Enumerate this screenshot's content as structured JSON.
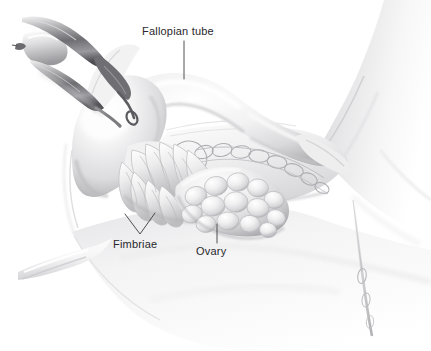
{
  "figure": {
    "kind": "medical-illustration",
    "style": "grayscale airbrush / pencil rendering",
    "background_color": "#ffffff",
    "width": 431,
    "height": 351
  },
  "palette": {
    "background": "#ffffff",
    "label_text": "#28282c",
    "leader_line": "#3c3c42",
    "tissue_light": "#fbfbfb",
    "tissue_mid": "#e3e3e4",
    "tissue_shadow": "#b9b9bb",
    "tissue_deep_shadow": "#8f8f93",
    "instrument_dark": "#5a5a5e",
    "instrument_mid": "#8d8d91",
    "vessel_gray": "#a6a6aa",
    "outline": "#cfcfd2"
  },
  "labels": [
    {
      "id": "fallopian-tube",
      "text": "Fallopian tube",
      "text_x": 142,
      "text_y": 35,
      "anchor": "start",
      "leader": {
        "type": "line",
        "x1": 184,
        "y1": 41,
        "x2": 184,
        "y2": 79
      }
    },
    {
      "id": "fimbriae",
      "text": "Fimbriae",
      "text_x": 113,
      "text_y": 248,
      "anchor": "start",
      "leader": {
        "type": "vee",
        "left_x": 125,
        "left_y": 214,
        "apex_x": 140,
        "apex_y": 234,
        "right_x": 155,
        "right_y": 213
      }
    },
    {
      "id": "ovary",
      "text": "Ovary",
      "text_x": 196,
      "text_y": 255,
      "anchor": "start",
      "leader": {
        "type": "line",
        "x1": 217,
        "y1": 224,
        "x2": 217,
        "y2": 243
      }
    }
  ],
  "anatomy_parts": [
    {
      "id": "surgical-forceps",
      "name": "Surgical forceps / clamp",
      "region": "top-left",
      "described": "metal grasping instrument holding tissue"
    },
    {
      "id": "uterine-horn",
      "name": "Uterine horn / cornu",
      "region": "upper-left-center"
    },
    {
      "id": "fallopian-tube-body",
      "name": "Fallopian tube (ampulla and isthmus)",
      "region": "center"
    },
    {
      "id": "fimbriae-fronds",
      "name": "Fimbriae",
      "region": "center-left",
      "described": "finger-like fronds fanning from infundibulum"
    },
    {
      "id": "ovary-body",
      "name": "Ovary",
      "region": "center",
      "described": "lobulated ovoid with follicular bumps"
    },
    {
      "id": "broad-ligament",
      "name": "Broad ligament (mesosalpinx)",
      "region": "center-right",
      "described": "translucent membrane with vascular arcade"
    },
    {
      "id": "vascular-arcade",
      "name": "Ovarian vessel arcade",
      "region": "center-right"
    },
    {
      "id": "round-ligament",
      "name": "Round ligament",
      "region": "lower-left",
      "described": "pale tubular cord extending to lower left"
    },
    {
      "id": "pelvic-sidewall",
      "name": "Pelvic sidewall",
      "region": "right"
    },
    {
      "id": "pelvic-floor",
      "name": "Pelvic floor peritoneum",
      "region": "bottom"
    }
  ]
}
